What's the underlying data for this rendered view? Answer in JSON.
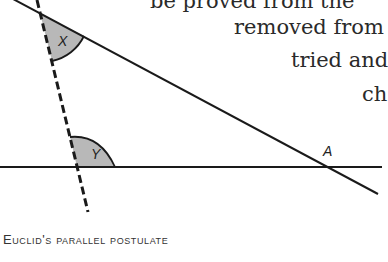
{
  "body_text": {
    "line1": "be proved from the",
    "line2": "removed from",
    "line3": "tried and",
    "line4": "ch"
  },
  "figure": {
    "labels": {
      "angle_x": "X",
      "angle_y": "Y",
      "point_a": "A"
    },
    "colors": {
      "line": "#1a1a1a",
      "angle_fill": "#b8b8b8"
    }
  },
  "caption": "Euclid's parallel postulate"
}
